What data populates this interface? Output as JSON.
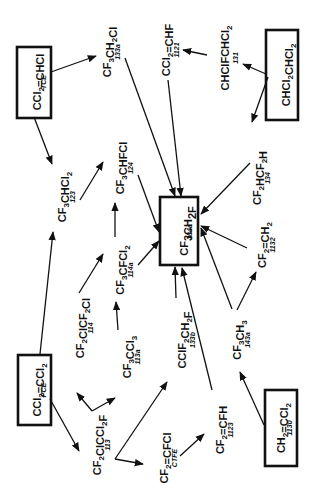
{
  "diagram": {
    "orientation": "rotated-90-ccw",
    "target": {
      "id": "134a",
      "formula_parts": [
        [
          "CF",
          ""
        ],
        [
          "3",
          "sub"
        ],
        [
          "CH",
          ""
        ],
        [
          "2",
          "sub"
        ],
        [
          "F",
          ""
        ]
      ],
      "code": "134a"
    },
    "nodes": [
      {
        "id": "TCE",
        "boxed": true,
        "code": "TCE",
        "parts": [
          [
            "CCl",
            ""
          ],
          [
            "2",
            "sub"
          ],
          [
            "=CHCl",
            ""
          ]
        ]
      },
      {
        "id": "133a",
        "boxed": false,
        "code": "133a",
        "parts": [
          [
            "CF",
            ""
          ],
          [
            "3",
            "sub"
          ],
          [
            "CH",
            ""
          ],
          [
            "2",
            "sub"
          ],
          [
            "Cl",
            ""
          ]
        ]
      },
      {
        "id": "1121",
        "boxed": false,
        "code": "1121",
        "parts": [
          [
            "CCl",
            ""
          ],
          [
            "2",
            "sub"
          ],
          [
            "=CHF",
            ""
          ]
        ]
      },
      {
        "id": "131",
        "boxed": false,
        "code": "131",
        "parts": [
          [
            "CHClFCHCl",
            ""
          ],
          [
            "2",
            "sub"
          ]
        ]
      },
      {
        "id": "130",
        "boxed": true,
        "code": "",
        "parts": [
          [
            "CHCl",
            ""
          ],
          [
            "2",
            "sub"
          ],
          [
            "CHCl",
            ""
          ],
          [
            "2",
            "sub"
          ]
        ]
      },
      {
        "id": "123",
        "boxed": false,
        "code": "123",
        "parts": [
          [
            "CF",
            ""
          ],
          [
            "3",
            "sub"
          ],
          [
            "CHCl",
            ""
          ],
          [
            "2",
            "sub"
          ]
        ]
      },
      {
        "id": "124",
        "boxed": false,
        "code": "124",
        "parts": [
          [
            "CF",
            ""
          ],
          [
            "3",
            "sub"
          ],
          [
            "CHFCl",
            ""
          ]
        ]
      },
      {
        "id": "134",
        "boxed": false,
        "code": "134",
        "parts": [
          [
            "CF",
            ""
          ],
          [
            "2",
            "sub"
          ],
          [
            "HCF",
            ""
          ],
          [
            "2",
            "sub"
          ],
          [
            "H",
            ""
          ]
        ]
      },
      {
        "id": "114a",
        "boxed": false,
        "code": "114a",
        "parts": [
          [
            "CF",
            ""
          ],
          [
            "3",
            "sub"
          ],
          [
            "CFCl",
            ""
          ],
          [
            "2",
            "sub"
          ]
        ]
      },
      {
        "id": "1132",
        "boxed": false,
        "code": "1132",
        "parts": [
          [
            "CF",
            ""
          ],
          [
            "2",
            "sub"
          ],
          [
            "=CH",
            ""
          ],
          [
            "2",
            "sub"
          ]
        ]
      },
      {
        "id": "114",
        "boxed": false,
        "code": "114",
        "parts": [
          [
            "CF",
            ""
          ],
          [
            "2",
            "sub"
          ],
          [
            "ClCF",
            ""
          ],
          [
            "2",
            "sub"
          ],
          [
            "Cl",
            ""
          ]
        ]
      },
      {
        "id": "113a",
        "boxed": false,
        "code": "113a",
        "parts": [
          [
            "CF",
            ""
          ],
          [
            "3",
            "sub"
          ],
          [
            "CCl",
            ""
          ],
          [
            "3",
            "sub"
          ]
        ]
      },
      {
        "id": "133b",
        "boxed": false,
        "code": "133b",
        "parts": [
          [
            "CClF",
            ""
          ],
          [
            "2",
            "sub"
          ],
          [
            "CH",
            ""
          ],
          [
            "2",
            "sub"
          ],
          [
            "F",
            ""
          ]
        ]
      },
      {
        "id": "143a",
        "boxed": false,
        "code": "143a",
        "parts": [
          [
            "CF",
            ""
          ],
          [
            "3",
            "sub"
          ],
          [
            "CH",
            ""
          ],
          [
            "3",
            "sub"
          ]
        ]
      },
      {
        "id": "PCE",
        "boxed": true,
        "code": "PCE",
        "parts": [
          [
            "CCl",
            ""
          ],
          [
            "2",
            "sub"
          ],
          [
            "=CCl",
            ""
          ],
          [
            "2",
            "sub"
          ]
        ]
      },
      {
        "id": "113",
        "boxed": false,
        "code": "113",
        "parts": [
          [
            "CF",
            ""
          ],
          [
            "2",
            "sub"
          ],
          [
            "ClCCl",
            ""
          ],
          [
            "2",
            "sub"
          ],
          [
            "F",
            ""
          ]
        ]
      },
      {
        "id": "CTFE",
        "boxed": false,
        "code": "CTFE",
        "parts": [
          [
            "CF",
            ""
          ],
          [
            "2",
            "sub"
          ],
          [
            "=CFCl",
            ""
          ]
        ]
      },
      {
        "id": "1123",
        "boxed": false,
        "code": "1123",
        "parts": [
          [
            "CF",
            ""
          ],
          [
            "2",
            "sub"
          ],
          [
            "=CFH",
            ""
          ]
        ]
      },
      {
        "id": "1130",
        "boxed": true,
        "code": "1130",
        "parts": [
          [
            "CH",
            ""
          ],
          [
            "2",
            "sub"
          ],
          [
            "=CCl",
            ""
          ],
          [
            "2",
            "sub"
          ]
        ]
      }
    ],
    "edges": [
      [
        "TCE",
        "133a"
      ],
      [
        "TCE",
        "123"
      ],
      [
        "133a",
        "134a"
      ],
      [
        "1121",
        "134a"
      ],
      [
        "131",
        "1121"
      ],
      [
        "130",
        "131"
      ],
      [
        "130",
        "134"
      ],
      [
        "123",
        "124"
      ],
      [
        "124",
        "134a"
      ],
      [
        "134",
        "134a"
      ],
      [
        "114a",
        "124"
      ],
      [
        "114a",
        "134a"
      ],
      [
        "1132",
        "134a"
      ],
      [
        "114",
        "114a"
      ],
      [
        "113a",
        "114a"
      ],
      [
        "133b",
        "134a"
      ],
      [
        "143a",
        "134a"
      ],
      [
        "143a",
        "1132"
      ],
      [
        "PCE",
        "123"
      ],
      [
        "PCE",
        "113"
      ],
      [
        "113",
        "114"
      ],
      [
        "113",
        "113a"
      ],
      [
        "113",
        "CTFE"
      ],
      [
        "113",
        "133b"
      ],
      [
        "CTFE",
        "1123"
      ],
      [
        "1123",
        "134a"
      ],
      [
        "1130",
        "143a"
      ]
    ]
  }
}
